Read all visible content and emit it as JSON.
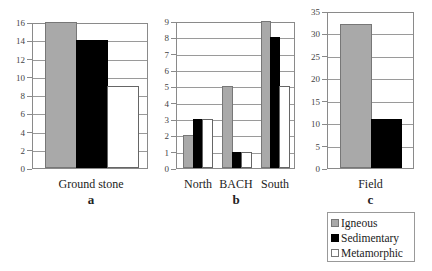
{
  "chart_data": [
    {
      "type": "bar",
      "panel": "a",
      "title": "",
      "categories": [
        "Ground stone"
      ],
      "series": [
        {
          "name": "Igneous",
          "values": [
            16
          ]
        },
        {
          "name": "Sedimentary",
          "values": [
            14
          ]
        },
        {
          "name": "Metamorphic",
          "values": [
            9
          ]
        }
      ],
      "xlabel": "Ground stone",
      "ylabel": "",
      "ylim": [
        0,
        16
      ],
      "yticks": [
        0,
        2,
        4,
        6,
        8,
        10,
        12,
        14,
        16
      ],
      "grid": true
    },
    {
      "type": "bar",
      "panel": "b",
      "title": "",
      "categories": [
        "North",
        "BACH",
        "South"
      ],
      "series": [
        {
          "name": "Igneous",
          "values": [
            2,
            5,
            9
          ]
        },
        {
          "name": "Sedimentary",
          "values": [
            3,
            1,
            8
          ]
        },
        {
          "name": "Metamorphic",
          "values": [
            3,
            1,
            5
          ]
        }
      ],
      "xlabel": "",
      "ylabel": "",
      "ylim": [
        0,
        9
      ],
      "yticks": [
        0,
        1,
        2,
        3,
        4,
        5,
        6,
        7,
        8,
        9
      ],
      "grid": true
    },
    {
      "type": "bar",
      "panel": "c",
      "title": "",
      "categories": [
        "Field"
      ],
      "series": [
        {
          "name": "Igneous",
          "values": [
            32
          ]
        },
        {
          "name": "Sedimentary",
          "values": [
            11
          ]
        },
        {
          "name": "Metamorphic",
          "values": [
            0
          ]
        }
      ],
      "xlabel": "Field",
      "ylabel": "",
      "ylim": [
        0,
        35
      ],
      "yticks": [
        0,
        5,
        10,
        15,
        20,
        25,
        30,
        35
      ],
      "grid": true
    }
  ],
  "panels": {
    "a": {
      "label": "a",
      "category": "Ground stone"
    },
    "b": {
      "label": "b",
      "categories": [
        "North",
        "BACH",
        "South"
      ]
    },
    "c": {
      "label": "c",
      "category": "Field"
    }
  },
  "legend": {
    "position": "bottom-right",
    "items": [
      {
        "label": "Igneous",
        "color": "#a9a9a9"
      },
      {
        "label": "Sedimentary",
        "color": "#000000"
      },
      {
        "label": "Metamorphic",
        "color": "#ffffff"
      }
    ]
  }
}
